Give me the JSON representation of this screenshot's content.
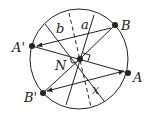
{
  "diagram": {
    "labels": {
      "A": "A",
      "A_prime": "A'",
      "B": "B",
      "B_prime": "B'",
      "N": "N",
      "a": "a",
      "b": "b",
      "x": "x"
    },
    "colors": {
      "stroke": "#222222",
      "background": "#ffffff"
    }
  }
}
